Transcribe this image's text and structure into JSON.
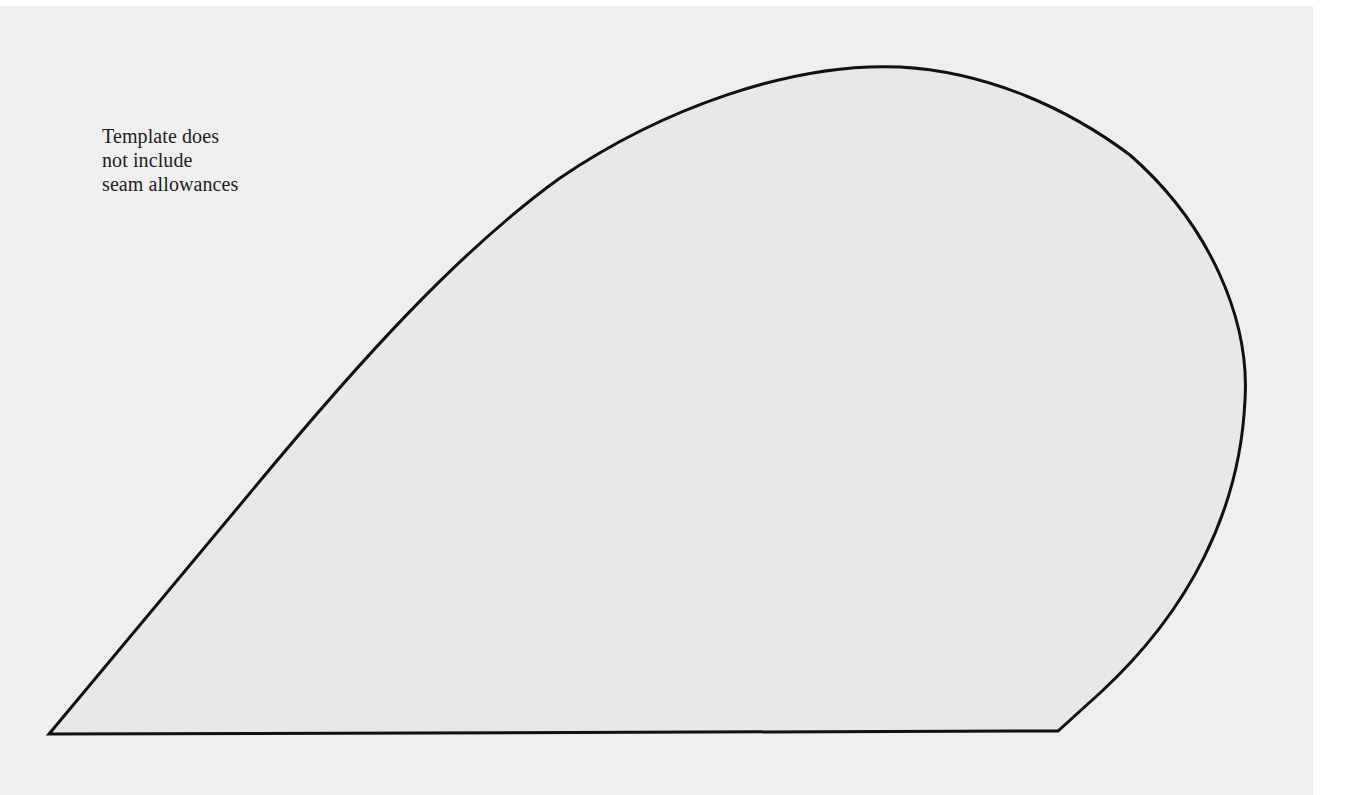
{
  "page": {
    "background_color": "#ffffff",
    "sheet_color": "#efefef"
  },
  "template": {
    "note_lines": [
      "Template does",
      "not include",
      "seam allowances"
    ],
    "shape": {
      "fill_color": "#e8e8e8",
      "stroke_color": "#111111",
      "stroke_width": 3,
      "path": "M 49 734 L 250 493 C 360 360 460 250 560 178 C 660 110 790 62 900 67 C 990 72 1070 110 1130 155 C 1210 225 1250 320 1245 400 C 1240 510 1190 610 1100 693 L 1058 731 Z"
    }
  }
}
